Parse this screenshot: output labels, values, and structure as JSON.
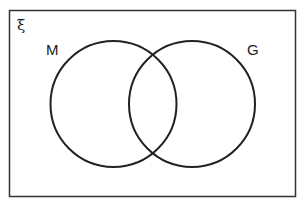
{
  "diagram": {
    "type": "venn",
    "universal_symbol": "ξ",
    "sets": [
      {
        "label": "M"
      },
      {
        "label": "G"
      }
    ],
    "colors": {
      "stroke": "#222222",
      "background": "#ffffff"
    }
  }
}
